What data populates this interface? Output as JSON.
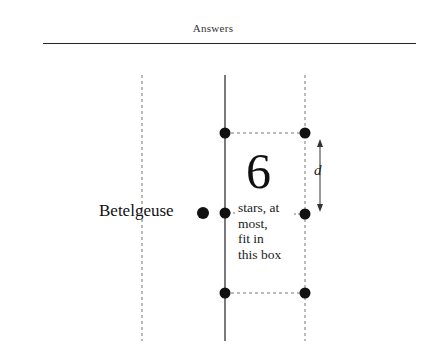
{
  "header": {
    "title": "Answers"
  },
  "diagram": {
    "star_label": "Betelgeuse",
    "count": "6",
    "caption_lines": [
      "stars, at",
      "most,",
      "fit in",
      "this box"
    ],
    "distance_label": "d",
    "colors": {
      "ink": "#111111",
      "dashed": "#777777"
    },
    "lines": {
      "solid_x": 225,
      "dashed_left_x": 142,
      "dashed_right_x": 305,
      "top_y": 75,
      "bottom_y": 341
    },
    "dots": [
      {
        "x": 225,
        "y": 133
      },
      {
        "x": 305,
        "y": 133
      },
      {
        "x": 225,
        "y": 213
      },
      {
        "x": 305,
        "y": 214
      },
      {
        "x": 225,
        "y": 293
      },
      {
        "x": 305,
        "y": 293
      }
    ],
    "betelgeuse_dot": {
      "x": 203,
      "y": 213
    }
  }
}
